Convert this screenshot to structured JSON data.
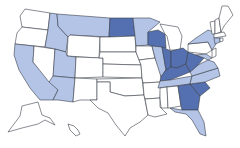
{
  "map": {
    "title": "United States",
    "colors": {
      "none": "#ffffff",
      "light": "#b3c4e6",
      "dark": "#5470b0",
      "border": "#3a3f4a"
    },
    "states": [
      {
        "id": "WA",
        "level": "none",
        "points": "25,9 50,13 48,30 22,27 20,16"
      },
      {
        "id": "OR",
        "level": "none",
        "points": "22,27 48,30 45,47 15,44 17,33"
      },
      {
        "id": "CA",
        "level": "light",
        "points": "15,44 34,46 33,62 58,90 53,100 40,100 30,88 19,70 14,55"
      },
      {
        "id": "NV",
        "level": "none",
        "points": "34,46 55,49 53,80 49,82 33,62"
      },
      {
        "id": "ID",
        "level": "light",
        "points": "50,13 57,14 58,26 68,37 66,52 55,49 45,47 48,30"
      },
      {
        "id": "MT",
        "level": "light",
        "points": "57,14 110,18 109,37 70,35 68,37 58,26"
      },
      {
        "id": "WY",
        "level": "none",
        "points": "70,35 100,37 99,58 67,56 68,37"
      },
      {
        "id": "UT",
        "level": "light",
        "points": "55,49 66,52 67,56 76,57 75,78 53,76"
      },
      {
        "id": "AZ",
        "level": "light",
        "points": "53,76 75,78 73,102 58,100 53,100 58,90 49,82"
      },
      {
        "id": "CO",
        "level": "none",
        "points": "76,57 103,58 103,77 75,78"
      },
      {
        "id": "NM",
        "level": "none",
        "points": "75,78 97,79 97,100 80,100 73,102"
      },
      {
        "id": "ND",
        "level": "dark",
        "points": "110,18 133,18 135,36 109,37"
      },
      {
        "id": "SD",
        "level": "none",
        "points": "109,37 135,36 136,52 100,52 100,37"
      },
      {
        "id": "NE",
        "level": "none",
        "points": "100,52 136,52 141,65 103,64 103,58 99,58"
      },
      {
        "id": "KS",
        "level": "none",
        "points": "103,64 141,65 142,78 103,77"
      },
      {
        "id": "OK",
        "level": "none",
        "points": "97,79 142,78 144,95 125,96 110,92 110,82 97,82"
      },
      {
        "id": "TX",
        "level": "none",
        "points": "97,82 110,82 110,92 125,96 144,95 148,115 140,122 130,128 125,136 116,125 108,113 98,108 90,100 97,100"
      },
      {
        "id": "MN",
        "level": "light",
        "points": "133,18 150,18 160,22 148,32 148,45 136,46 135,36"
      },
      {
        "id": "IA",
        "level": "none",
        "points": "136,46 152,46 155,58 139,60 136,52"
      },
      {
        "id": "MO",
        "level": "none",
        "points": "139,60 155,58 161,72 161,82 143,83 142,78 141,65"
      },
      {
        "id": "AR",
        "level": "none",
        "points": "143,83 161,82 160,98 145,99 144,95"
      },
      {
        "id": "LA",
        "level": "none",
        "points": "145,99 160,98 160,107 167,114 155,117 148,115"
      },
      {
        "id": "WI",
        "level": "dark",
        "points": "148,32 158,30 165,34 166,48 152,46 148,45"
      },
      {
        "id": "IL",
        "level": "light",
        "points": "152,46 162,47 166,70 161,77 155,58"
      },
      {
        "id": "MI",
        "level": "none",
        "points": "160,24 178,27 182,36 180,50 170,50 167,36 165,34"
      },
      {
        "id": "IN",
        "level": "dark",
        "points": "162,47 171,51 171,67 165,71 166,70"
      },
      {
        "id": "OH",
        "level": "dark",
        "points": "171,51 183,48 188,52 186,64 177,68 171,67"
      },
      {
        "id": "KY",
        "level": "dark",
        "points": "161,77 165,71 171,67 177,68 186,64 190,72 170,80 160,81"
      },
      {
        "id": "TN",
        "level": "light",
        "points": "160,81 170,80 192,76 190,84 158,88"
      },
      {
        "id": "MS",
        "level": "none",
        "points": "160,88 167,87 168,108 161,108 160,98"
      },
      {
        "id": "AL",
        "level": "none",
        "points": "167,87 178,86 181,106 170,108 168,108"
      },
      {
        "id": "GA",
        "level": "dark",
        "points": "178,86 190,84 200,96 198,110 182,110 181,106"
      },
      {
        "id": "FL",
        "level": "light",
        "points": "170,108 182,110 198,110 204,122 206,136 200,134 192,120 186,114 175,112"
      },
      {
        "id": "SC",
        "level": "dark",
        "points": "190,84 205,82 210,88 200,96"
      },
      {
        "id": "NC",
        "level": "light",
        "points": "192,76 218,68 220,76 205,82 190,84"
      },
      {
        "id": "VA",
        "level": "light",
        "points": "190,72 198,65 208,60 214,62 218,68 192,76"
      },
      {
        "id": "WV",
        "level": "dark",
        "points": "186,64 188,52 196,55 204,58 198,65 190,72"
      },
      {
        "id": "PA",
        "level": "none",
        "points": "188,44 208,42 212,50 206,54 188,52"
      },
      {
        "id": "NY",
        "level": "light",
        "points": "188,44 196,38 208,30 214,32 216,44 212,50 208,42"
      },
      {
        "id": "MD",
        "level": "light",
        "points": "196,55 206,54 212,58 208,60 204,58"
      },
      {
        "id": "NJ",
        "level": "none",
        "points": "212,50 216,48 216,56 212,58"
      },
      {
        "id": "VT",
        "level": "none",
        "points": "210,22 215,21 215,34 212,34"
      },
      {
        "id": "NH",
        "level": "none",
        "points": "215,20 219,18 221,32 215,34"
      },
      {
        "id": "ME",
        "level": "none",
        "points": "219,18 222,6 228,6 233,15 224,26 221,32"
      },
      {
        "id": "MA",
        "level": "none",
        "points": "214,34 224,32 226,36 214,38"
      },
      {
        "id": "CT",
        "level": "light",
        "points": "214,38 220,38 220,42 215,44"
      },
      {
        "id": "RI",
        "level": "none",
        "points": "220,38 223,38 223,41 220,42"
      },
      {
        "id": "AK",
        "level": "none",
        "points": "22,106 38,102 42,115 50,118 55,125 45,120 38,124 22,128 8,132 14,124 20,116"
      },
      {
        "id": "HI",
        "level": "none",
        "points": "68,124 74,126 78,130 80,134 76,136 70,130"
      }
    ]
  }
}
